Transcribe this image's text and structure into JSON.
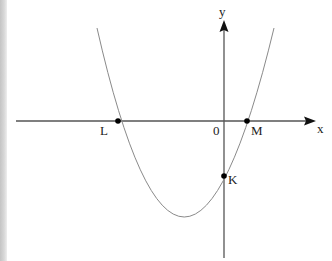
{
  "diagram": {
    "type": "parabola-graph",
    "axes": {
      "x_label": "x",
      "y_label": "y",
      "origin_label": "0"
    },
    "points": [
      {
        "name": "L",
        "label": "L",
        "description": "left x-intercept"
      },
      {
        "name": "M",
        "label": "M",
        "description": "right x-intercept"
      },
      {
        "name": "K",
        "label": "K",
        "description": "y-intercept"
      }
    ],
    "curve": {
      "kind": "upward-opening parabola",
      "color": "#8a8a8a"
    },
    "axis_color": "#555555",
    "point_color": "#000000"
  }
}
